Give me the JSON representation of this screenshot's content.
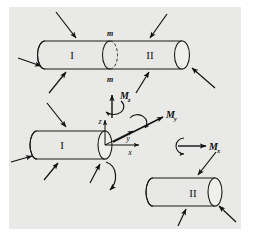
{
  "figure": {
    "background_color": "#ffffff",
    "panel_color": "#e9e9e7",
    "ink_color": "#111111",
    "panel": {
      "x": 9,
      "y": 7,
      "width": 232,
      "height": 222
    }
  },
  "top_assembly": {
    "part_left_label": "I",
    "part_right_label": "II",
    "section_label_top": "m",
    "section_label_bottom": "m",
    "cut_style": "dashed-ellipse",
    "load_arrow_count": 6
  },
  "free_body": {
    "part_left_label": "I",
    "axes": {
      "z_label": "z",
      "y_label": "y",
      "x_label": "x"
    },
    "moments": [
      {
        "name": "moment-z",
        "symbol": "M",
        "subscript": "z",
        "direction": "up"
      },
      {
        "name": "moment-y",
        "symbol": "M",
        "subscript": "y",
        "direction": "upper-right"
      },
      {
        "name": "moment-x",
        "symbol": "M",
        "subscript": "x",
        "direction": "right"
      }
    ],
    "separated_part_label": "II",
    "separation_indicator": "curved-arrow",
    "load_arrow_count_left": 4,
    "load_arrow_count_right": 3
  }
}
